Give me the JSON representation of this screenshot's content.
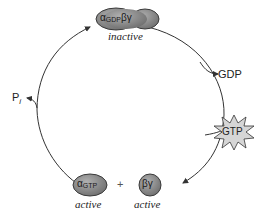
{
  "diagram": {
    "type": "cycle",
    "colors": {
      "complex_fill": "#8c8c8c",
      "complex_stroke": "#3a3a3a",
      "star_fill": "#d6d6d6",
      "arrow": "#333333"
    },
    "nodes": {
      "top": {
        "alpha": "α",
        "alpha_sub": "GDP",
        "beta_gamma": "βγ",
        "state": "inactive"
      },
      "bottom_left": {
        "alpha": "α",
        "alpha_sub": "GTP",
        "state": "active"
      },
      "plus": "+",
      "bottom_right": {
        "label": "βγ",
        "state": "active"
      }
    },
    "products": {
      "gdp": "GDP",
      "gtp": "GTP",
      "pi": "P",
      "pi_sub": "i"
    }
  }
}
